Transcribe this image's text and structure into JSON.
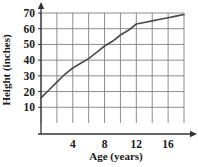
{
  "chart_data": {
    "type": "line",
    "title": "",
    "xlabel": "Age (years)",
    "ylabel": "Height (inches)",
    "xlim": [
      0,
      18
    ],
    "ylim": [
      0,
      70
    ],
    "xticks": [
      4,
      8,
      12,
      16
    ],
    "xtick_labels": [
      "4",
      "8",
      "12",
      "16"
    ],
    "yticks": [
      10,
      20,
      30,
      40,
      50,
      60,
      70
    ],
    "ytick_labels": [
      "10",
      "20",
      "30",
      "40",
      "50",
      "60",
      "70"
    ],
    "grid": true,
    "grid_x_step": 2,
    "grid_y_step": 10,
    "legend": "none",
    "series": [
      {
        "name": "Height",
        "x": [
          0,
          1,
          2,
          3,
          4,
          5,
          6,
          7,
          8,
          9,
          10,
          11,
          12,
          13,
          14,
          15,
          16,
          17,
          18
        ],
        "values": [
          16,
          21,
          26,
          31,
          35,
          38,
          41,
          45,
          49,
          52,
          56,
          59,
          63,
          64,
          65,
          66,
          67,
          68,
          69
        ]
      }
    ],
    "annotations": [
      {
        "label": "growth-curve-kink",
        "x": 12,
        "y": 63
      }
    ],
    "colors": {
      "curve": "#4a4a4a",
      "grid": "#808080",
      "axis": "#333333",
      "text": "#1a1a1a"
    }
  },
  "axis_labels": {
    "x_title": "Age (years)",
    "y_title": "Height (inches)"
  }
}
